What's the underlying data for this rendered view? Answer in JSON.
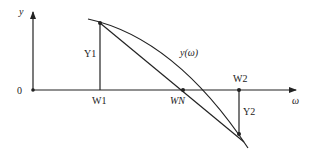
{
  "diagram": {
    "axes": {
      "y_label": "y",
      "x_label": "ω",
      "origin_label": "0"
    },
    "points": {
      "w1": "W1",
      "w2": "W2",
      "wn": "WN"
    },
    "segments": {
      "y1": "Y1",
      "y2": "Y2"
    },
    "curve_label": "y(ω)",
    "colors": {
      "stroke": "#222222",
      "background": "#ffffff"
    }
  }
}
